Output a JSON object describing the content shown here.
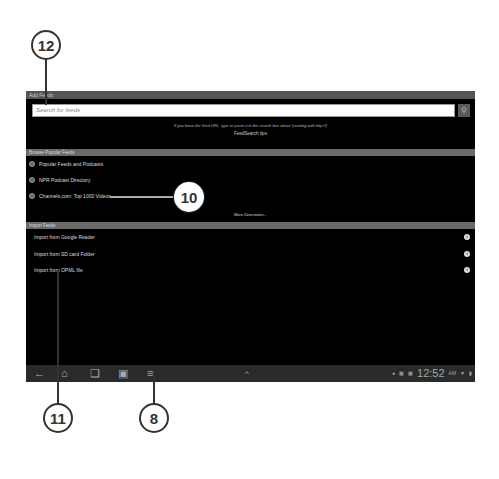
{
  "screen": {
    "title": "Add Feeds",
    "search": {
      "placeholder": "Search for feeds",
      "button_icon": "search-icon"
    },
    "hint": "If you know the feed URL, type or paste it in the search box above (starting with http://)",
    "hint_link": "FeedSearch tips",
    "browse_section": {
      "header": "Browse Popular Feeds",
      "items": [
        {
          "label": "Popular Feeds and Podcasts"
        },
        {
          "label": "NPR Podcast Directory"
        },
        {
          "label": "Channels.com: Top 1000 Videos"
        }
      ],
      "more": "More Directories..."
    },
    "import_section": {
      "header": "Import Feeds",
      "items": [
        {
          "label": "Import from Google Reader"
        },
        {
          "label": "Import from SD card Folder"
        },
        {
          "label": "Import from OPML file"
        }
      ]
    },
    "navbar": {
      "buttons": [
        "back-icon",
        "home-icon",
        "recent-apps-icon",
        "screenshot-icon",
        "menu-icon"
      ],
      "up_arrow": "^",
      "clock": "12:52",
      "ampm": "AM"
    }
  },
  "callouts": {
    "c12": "12",
    "c10": "10",
    "c11": "11",
    "c8": "8"
  }
}
